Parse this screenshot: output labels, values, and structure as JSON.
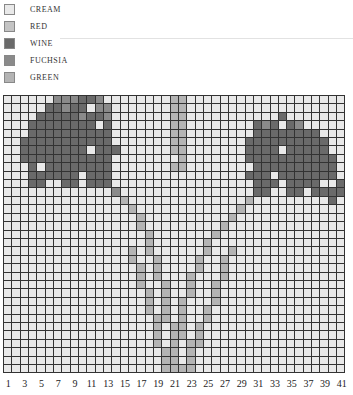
{
  "legend": [
    {
      "code": "C",
      "label": "CREAM",
      "color": "#e9e9e9"
    },
    {
      "code": "R",
      "label": "RED",
      "color": "#c4c4c4"
    },
    {
      "code": "W",
      "label": "WINE",
      "color": "#6a6a6a"
    },
    {
      "code": "F",
      "label": "FUCHSIA",
      "color": "#8a8a8a"
    },
    {
      "code": "G",
      "label": "GREEN",
      "color": "#b4b4b4"
    }
  ],
  "chart": {
    "columns": 41,
    "rows": 33,
    "x_tick_labels": [
      "1",
      "3",
      "5",
      "7",
      "9",
      "11",
      "13",
      "15",
      "17",
      "19",
      "21",
      "23",
      "25",
      "27",
      "29",
      "31",
      "33",
      "35",
      "37",
      "39",
      "41"
    ],
    "grid": [
      "CCCCCCFFFWWFCCCCCCCCGGCCCCCCCCCCCCCCCCCCC",
      "CCCCCWWFWWCFFCCCCCCCGGCCCCCCCCCCCCCCCCCCC",
      "CCCCWWWWWFWWFCCCCCCCGGCCCCCCCCCCCWCCCCCCC",
      "CCCWWWWWWWWCWCCCCCCCGGCCCCCCCCWFWCWFCCCCC",
      "CCCWWWWWWWWWWCCCCCCCGGCCCCCCCCWWWWWWWWCCC",
      "CCWWWWWWWWWWWCCCCCCCGGCCCCCCCWWWWWWWWWWCC",
      "CCWWWWWWWWCWWWCCCCCCGGCCCCCCCWWWWCWWWWWCC",
      "CCWWWWWWWWWWWCCCCCCCCGCCCCCCCWWWWWWWWWWWC",
      "CCCWCWWWWWWWWCCCCCCCGGCCCCCCCCWWWWWWWWWWC",
      "CCCWWWWWWCWWWCCCCCCCCCCCCCCCCWWWCWWWWWWWC",
      "CCCWWCCWWCWWWCCCCCCCCCCCCCCCCCWWWCWWWWCCW",
      "CCCCCCCCCCCCCFCCCCCCCCCCCCCCCCWWCCWWCWWWW",
      "CCCCCCCCCCCCCCGCCCCCCCCCCCCCCGCCCCCCCCCWC",
      "CCCCCCCCCCCCCCCGCCCCCCCCCCCCGCCCCCCCCCCCC",
      "CCCCCCCCCCCCCCCCGCCCCCCCCCCGCCCCCCCCCCCCC",
      "CCCCCCCCCCCCCCCCGCCCCCCCCCGCCCCCCCCCCCCCC",
      "CCCCCCCCCCCCCCCCCGCCCCCCCGCCCCCCCCCCCCCCC",
      "CCCCCCCCCCCCCCCCCGCCCCCCGCCCCCCCCCCCCCCCC",
      "CCCCCCCCCCCCCCCGCGCCCCCCGCCGCCCCCCCCCCCCC",
      "CCCCCCCCCCCCCCCGCCGCCCCGCCGCCCCCCCCCCCCCC",
      "CCCCCCCCCCCCCCCCGCGCCCCGCCGCCCCCCCCCCCCCC",
      "CCCCCCCCCCCCCCCCGCGCCCGCCCGCCCCCCCCCCCCCC",
      "CCCCCCCCCCCCCCCCGCCGCCGCCGCCCCCCCCCCCCCCC",
      "CCCCCCCCCCCCCCCCCGCGCCGCCGCCCCCCCCCCCCCCC",
      "CCCCCCCCCCCCCCCCCGCGCGCCCGCCCCCCCCCCCCCCC",
      "CCCCCCCCCCCCCCCCCGCGCGCCGCCCCCCCCCCCCCCCC",
      "CCCCCCCCCCCCCCCCCCGGCGCCGCCCCCCCCCCCCCCCC",
      "CCCCCCCCCCCCCCCCCCGCGGCGCCCCCCCCCCCCCCCCC",
      "CCCCCCCCCCCCCCCCCCGCGGCGCCCCCCCCCCCCCCCCC",
      "CCCCCCCCCCCCCCCCCCGCGCGGCCCCCCCCCCCCCCCCC",
      "CCCCCCCCCCCCCCCCCCCGGCGCCCCCCCCCCCCCCCCCC",
      "CCCCCCCCCCCCCCCCCCCGGCGCCCCCCCCCCCCCCCCCC",
      "CCCCCCCCCCCCCCCCCCCGGGGCCCCCCCCCCCCCCCCCC"
    ]
  }
}
